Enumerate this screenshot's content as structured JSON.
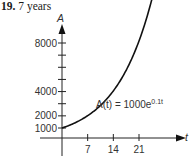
{
  "problem": {
    "number": "19.",
    "answer": "7 years"
  },
  "chart_data": {
    "type": "line",
    "title": "",
    "xlabel": "t",
    "ylabel": "A",
    "equation": "A(t) = 1000e^{0.1t}",
    "equation_parts": {
      "lhs": "A(t) = 1000e",
      "exp": "0.1t"
    },
    "x_ticks": [
      7,
      14,
      21
    ],
    "x_tick_labels": [
      "7",
      "14",
      "21"
    ],
    "y_ticks": [
      1000,
      2000,
      3000,
      4000,
      5000,
      6000,
      7000,
      8000
    ],
    "y_tick_labels": {
      "1000": "1000",
      "2000": "2000",
      "4000": "4000",
      "8000": "8000"
    },
    "xlim": [
      0,
      30
    ],
    "ylim": [
      0,
      9000
    ],
    "x": [
      0,
      3,
      6,
      7,
      9,
      12,
      14,
      15,
      18,
      21,
      24,
      25.5
    ],
    "values": [
      1000,
      1350,
      1822,
      2014,
      2460,
      3320,
      4055,
      4482,
      6050,
      8166,
      11023,
      12807
    ],
    "grid": false,
    "legend": null
  }
}
